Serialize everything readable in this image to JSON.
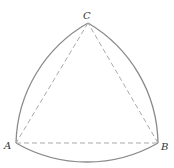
{
  "diagram": {
    "type": "reuleaux-triangle",
    "colors": {
      "arc": "#8a8a8a",
      "dashed": "#aaaaaa",
      "label": "#333333"
    },
    "vertices": [
      {
        "id": "A",
        "label": "A",
        "x": 16,
        "y": 143
      },
      {
        "id": "B",
        "label": "B",
        "x": 158,
        "y": 143
      },
      {
        "id": "C",
        "label": "C",
        "x": 88,
        "y": 23
      }
    ],
    "labels": {
      "a": "A",
      "b": "B",
      "c": "C"
    }
  }
}
